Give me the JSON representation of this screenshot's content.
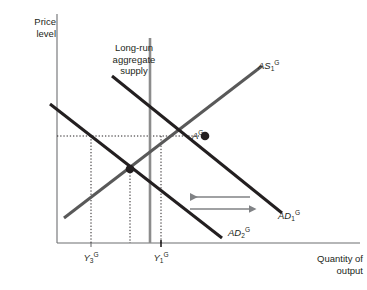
{
  "figure": {
    "type": "economics-diagram",
    "axes": {
      "y_label_line1": "Price",
      "y_label_line2": "level",
      "x_label_line1": "Quantity of",
      "x_label_line2": "output"
    },
    "annotations": {
      "lras_line1": "Long-run",
      "lras_line2": "aggregate",
      "lras_line3": "supply"
    },
    "curves": [
      {
        "name": "as1",
        "base": "AS",
        "sub": "1",
        "sup": "G",
        "color": "#595959",
        "style": "upward-sloping"
      },
      {
        "name": "ad1",
        "base": "AD",
        "sub": "1",
        "sup": "G",
        "color": "#231f20",
        "style": "downward-sloping"
      },
      {
        "name": "ad2",
        "base": "AD",
        "sub": "2",
        "sup": "G",
        "color": "#231f20",
        "style": "downward-sloping"
      },
      {
        "name": "lras",
        "base": "",
        "sub": "",
        "sup": "",
        "color": "#8c8c8c",
        "style": "vertical"
      }
    ],
    "points": [
      {
        "name": "equilibrium-a",
        "base": "A",
        "sub": "",
        "sup": "G",
        "x": 205,
        "y": 136
      },
      {
        "name": "intersection-2",
        "base": "",
        "sub": "",
        "sup": "",
        "x": 130,
        "y": 169
      }
    ],
    "xticks": [
      {
        "name": "y3",
        "base": "Y",
        "sub": "3",
        "sup": "G",
        "x": 91
      },
      {
        "name": "y1",
        "base": "Y",
        "sub": "1",
        "sup": "G",
        "x": 161
      }
    ],
    "arrows": [
      {
        "name": "leftward-shift-arrow",
        "direction": "left"
      },
      {
        "name": "rightward-shift-arrow",
        "direction": "right"
      }
    ],
    "colors": {
      "axis": "#6d6e71",
      "dotted": "#231f20",
      "dark_curve": "#231f20",
      "gray_curve": "#595959",
      "lras": "#8c8c8c",
      "arrow": "#808285",
      "text": "#231f20",
      "background": "#ffffff"
    }
  }
}
